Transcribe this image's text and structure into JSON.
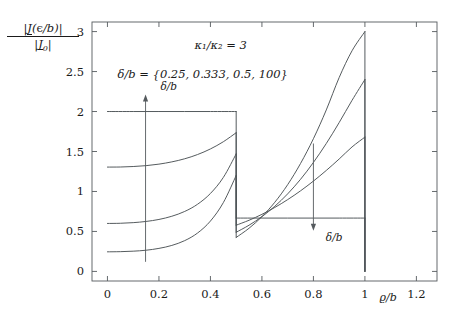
{
  "figure": {
    "y_axis_label_numerator": "|J(ϱ/b)|",
    "y_axis_label_denominator": "|J₀|",
    "x_axis_label": "ϱ/b",
    "annotation_ratio": "κ₁/κ₂ = 3",
    "annotation_delta_set": "δ/b = {0.25, 0.333, 0.5, 100}",
    "arrow_label_up": "δ/b",
    "arrow_label_down": "δ/b",
    "line_color": "#4c5255",
    "frame_color": "#555a5e"
  },
  "chart_data": {
    "type": "line",
    "title": "",
    "xlabel": "ϱ/b",
    "ylabel": "|J(ϱ/b)| / |J₀|",
    "xlim": [
      -0.06,
      1.28
    ],
    "ylim": [
      -0.12,
      3.12
    ],
    "xticks": [
      0,
      0.2,
      0.4,
      0.6,
      0.8,
      1,
      1.2
    ],
    "xticklabels": [
      "0",
      "0.2",
      "0.4",
      "0.6",
      "0.8",
      "1",
      "1.2"
    ],
    "yticks": [
      0,
      0.5,
      1,
      1.5,
      2,
      2.5,
      3
    ],
    "yticklabels": [
      "0",
      "0.5",
      "1",
      "1.5",
      "2",
      "2.5",
      "3"
    ],
    "grid": false,
    "legend": "none",
    "annotations": [
      {
        "text": "κ₁/κ₂ = 3",
        "x": 0.44,
        "y": 2.78
      },
      {
        "text": "δ/b = {0.25, 0.333, 0.5, 100}",
        "x": 0.37,
        "y": 2.42
      },
      {
        "text": "δ/b",
        "x": 0.175,
        "y": 2.3,
        "arrow": "up",
        "arrow_from": [
          0.148,
          0.12
        ],
        "arrow_to": [
          0.148,
          2.2
        ]
      },
      {
        "text": "δ/b",
        "x": 0.825,
        "y": 0.42,
        "arrow": "down",
        "arrow_from": [
          0.8,
          1.6
        ],
        "arrow_to": [
          0.8,
          0.52
        ]
      }
    ],
    "discontinuity_x": 0.5,
    "outer_edge_x": 1.0,
    "series": [
      {
        "name": "δ/b = 100",
        "inner_x": [
          0.0,
          0.1,
          0.2,
          0.3,
          0.4,
          0.5
        ],
        "inner_y": [
          2.0,
          2.0,
          2.0,
          2.0,
          2.0,
          2.0
        ],
        "outer_x": [
          0.5,
          0.6,
          0.7,
          0.8,
          0.9,
          1.0
        ],
        "outer_y": [
          0.667,
          0.667,
          0.667,
          0.667,
          0.667,
          0.667
        ],
        "drop_to_zero_at_1": true
      },
      {
        "name": "δ/b = 0.5",
        "inner_x": [
          0.0,
          0.05,
          0.1,
          0.15,
          0.2,
          0.25,
          0.3,
          0.35,
          0.4,
          0.45,
          0.5
        ],
        "inner_y": [
          1.305,
          1.306,
          1.312,
          1.323,
          1.342,
          1.37,
          1.409,
          1.462,
          1.532,
          1.622,
          1.735
        ],
        "outer_x": [
          0.5,
          0.55,
          0.6,
          0.65,
          0.7,
          0.75,
          0.8,
          0.85,
          0.9,
          0.95,
          1.0
        ],
        "outer_y": [
          0.578,
          0.64,
          0.714,
          0.8,
          0.898,
          1.008,
          1.13,
          1.263,
          1.406,
          1.557,
          1.68
        ],
        "drop_to_zero_at_1": false
      },
      {
        "name": "δ/b = 0.333",
        "inner_x": [
          0.0,
          0.05,
          0.1,
          0.15,
          0.2,
          0.25,
          0.3,
          0.35,
          0.4,
          0.45,
          0.5
        ],
        "inner_y": [
          0.6,
          0.602,
          0.61,
          0.625,
          0.65,
          0.69,
          0.75,
          0.84,
          0.975,
          1.175,
          1.47
        ],
        "outer_x": [
          0.5,
          0.55,
          0.6,
          0.65,
          0.7,
          0.75,
          0.8,
          0.85,
          0.9,
          0.95,
          1.0
        ],
        "outer_y": [
          0.49,
          0.578,
          0.685,
          0.815,
          0.97,
          1.152,
          1.363,
          1.6,
          1.862,
          2.14,
          2.4
        ],
        "drop_to_zero_at_1": false
      },
      {
        "name": "δ/b = 0.25",
        "inner_x": [
          0.0,
          0.05,
          0.1,
          0.15,
          0.2,
          0.25,
          0.3,
          0.35,
          0.4,
          0.45,
          0.5
        ],
        "inner_y": [
          0.245,
          0.247,
          0.253,
          0.265,
          0.288,
          0.325,
          0.385,
          0.48,
          0.63,
          0.86,
          1.2
        ],
        "outer_x": [
          0.5,
          0.55,
          0.6,
          0.65,
          0.7,
          0.75,
          0.8,
          0.85,
          0.9,
          0.95,
          1.0
        ],
        "outer_y": [
          0.425,
          0.54,
          0.685,
          0.865,
          1.085,
          1.35,
          1.66,
          2.02,
          2.425,
          2.76,
          3.0
        ],
        "drop_to_zero_at_1": false
      }
    ]
  }
}
